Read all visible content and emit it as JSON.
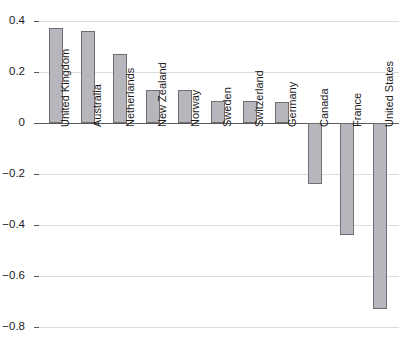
{
  "chart_data": {
    "type": "bar",
    "title": "",
    "subtitle": "",
    "xlabel": "",
    "ylabel": "",
    "categories": [
      "United Kingdom",
      "Australia",
      "Netherlands",
      "New Zealand",
      "Norway",
      "Sweden",
      "Switzerland",
      "Germany",
      "Canada",
      "France",
      "United States"
    ],
    "values": [
      0.37,
      0.36,
      0.27,
      0.13,
      0.13,
      0.085,
      0.085,
      0.08,
      -0.24,
      -0.44,
      -0.73
    ],
    "ylim": [
      -0.85,
      0.45
    ],
    "yticks": [
      0.4,
      0.2,
      0,
      -0.2,
      -0.4,
      -0.6,
      -0.8
    ],
    "ytick_labels": [
      "0.4",
      "0.2",
      "0",
      "−0.2",
      "−0.4",
      "−0.6",
      "−0.8"
    ],
    "grid": true,
    "legend": false,
    "legend_position": "none",
    "bar_color": "#b6b6bc",
    "bar_border_color": "#6e6e74",
    "gridline_color": "#dcdcdc",
    "zero_line_color": "#5a5a5a"
  }
}
